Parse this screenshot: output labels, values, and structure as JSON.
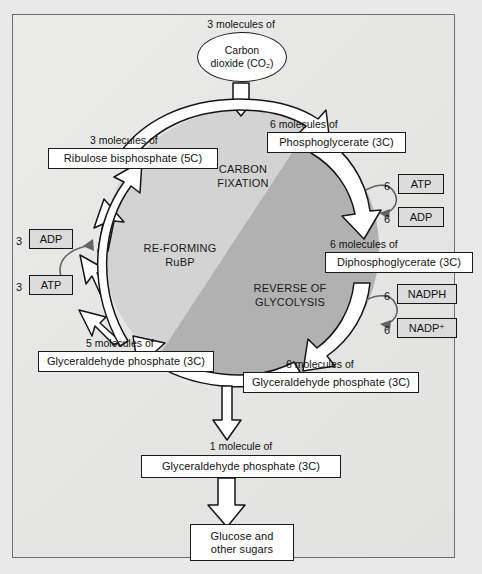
{
  "diagram": {
    "colors": {
      "page_background": "#e9e9e9",
      "panel_background": "#e5e5e5",
      "frame_border": "#6e6e6e",
      "circle_light": "#d2d2d2",
      "circle_dark": "#b0b0b0",
      "arrow_fill": "#ffffff",
      "arrow_stroke": "#151515",
      "cofactor_fill": "#dcdcdc",
      "text": "#121212"
    }
  },
  "nodes": {
    "carbon_dioxide": {
      "caption": "3 molecules of",
      "line1": "Carbon",
      "line2": "dioxide (CO₂)"
    },
    "phosphoglycerate": {
      "caption": "6 molecules of",
      "label": "Phosphoglycerate (3C)"
    },
    "diphosphoglycerate": {
      "caption": "6 molecules of",
      "label": "Diphosphoglycerate (3C)"
    },
    "glyceraldehyde_phosphate_right": {
      "caption": "6 molecules of",
      "label": "Glyceraldehyde phosphate (3C)"
    },
    "glyceraldehyde_phosphate_left": {
      "caption": "5 molecules of",
      "label": "Glyceraldehyde phosphate (3C)"
    },
    "ribulose_bisphosphate": {
      "caption": "3 molecules of",
      "label": "Ribulose bisphosphate (5C)"
    },
    "glyceraldehyde_phosphate_out": {
      "caption": "1 molecule of",
      "label": "Glyceraldehyde phosphate (3C)"
    },
    "glucose": {
      "line1": "Glucose and",
      "line2": "other sugars"
    }
  },
  "cycle_labels": {
    "carbon_fixation": {
      "line1": "CARBON",
      "line2": "FIXATION"
    },
    "reforming_rubp": {
      "line1": "RE-FORMING",
      "line2": "RuBP"
    },
    "reverse_of_glycolysis": {
      "line1": "REVERSE OF",
      "line2": "GLYCOLYSIS"
    }
  },
  "cofactors": {
    "atp_right": {
      "coefficient": "6",
      "label": "ATP"
    },
    "adp_right": {
      "coefficient": "6",
      "label": "ADP"
    },
    "nadph": {
      "coefficient": "6",
      "label": "NADPH"
    },
    "nadp_plus": {
      "coefficient": "6",
      "label": "NADP⁺"
    },
    "adp_left": {
      "coefficient": "3",
      "label": "ADP"
    },
    "atp_left": {
      "coefficient": "3",
      "label": "ATP"
    }
  }
}
